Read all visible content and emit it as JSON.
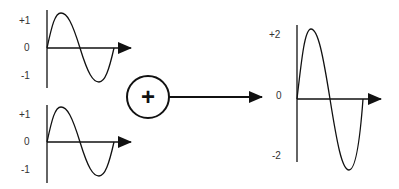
{
  "diagram": {
    "title": "",
    "colors": {
      "stroke": "#111111",
      "label": "#333333",
      "background": "#ffffff"
    },
    "inputs": [
      {
        "name": "input-wave-1",
        "type": "sine",
        "amplitude": 1,
        "cycles": 1,
        "y_labels": {
          "top": "+1",
          "zero": "0",
          "bottom": "-1"
        }
      },
      {
        "name": "input-wave-2",
        "type": "sine",
        "amplitude": 1,
        "cycles": 1,
        "y_labels": {
          "top": "+1",
          "zero": "0",
          "bottom": "-1"
        }
      }
    ],
    "operator": {
      "name": "sum-operator",
      "symbol": "+",
      "icon": "plus-in-circle-icon"
    },
    "output": {
      "name": "output-wave",
      "type": "sine",
      "amplitude": 2,
      "cycles": 1,
      "y_labels": {
        "top": "+2",
        "zero": "0",
        "bottom": "-2"
      }
    }
  }
}
